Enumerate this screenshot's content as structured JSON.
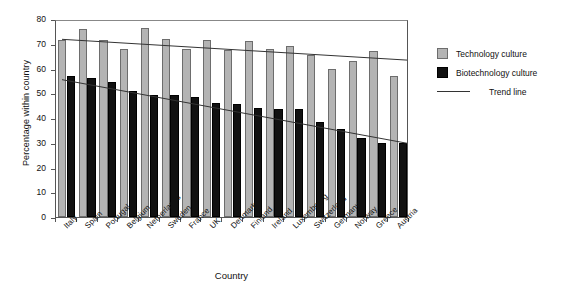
{
  "chart_data": {
    "type": "bar",
    "title": "",
    "xlabel": "Country",
    "ylabel": "Percentage within country",
    "ylim": [
      0,
      80
    ],
    "ytick_step": 10,
    "yticks": [
      80,
      70,
      60,
      50,
      40,
      30,
      20,
      10,
      0
    ],
    "grid": false,
    "legend_position": "right",
    "categories": [
      "Italy",
      "Spain",
      "Portugal",
      "Belgium",
      "Netherlands",
      "Sweden",
      "France",
      "UK",
      "Denmark",
      "Finland",
      "Ireland",
      "Luxembourg",
      "Switzerland",
      "Germany",
      "Norway",
      "Greece",
      "Austria"
    ],
    "series": [
      {
        "name": "Technology culture",
        "color": "#b4b4b4",
        "values": [
          71.5,
          76,
          71.5,
          68,
          76.5,
          72,
          68,
          71.5,
          67.5,
          71,
          68,
          69,
          65.5,
          60,
          63,
          67,
          57
        ]
      },
      {
        "name": "Biotechnology  culture",
        "color": "#111111",
        "values": [
          57,
          56,
          54.5,
          51,
          49.5,
          49.5,
          48.5,
          46,
          45.5,
          44,
          43.5,
          43.5,
          38.5,
          35.5,
          32,
          30,
          30
        ]
      }
    ],
    "trend_lines": [
      {
        "name": "Trend line",
        "for_series": "Technology culture",
        "start_value": 72.6,
        "end_value": 64.2,
        "color": "#333333"
      },
      {
        "name": "Trend line",
        "for_series": "Biotechnology  culture",
        "start_value": 56.3,
        "end_value": 30.6,
        "color": "#333333"
      }
    ],
    "legend_entries": [
      {
        "label": "Technology culture",
        "marker": "swatch",
        "color": "#b4b4b4"
      },
      {
        "label": "Biotechnology  culture",
        "marker": "swatch",
        "color": "#111111"
      },
      {
        "label": "Trend line",
        "marker": "line",
        "color": "#333333"
      }
    ]
  }
}
